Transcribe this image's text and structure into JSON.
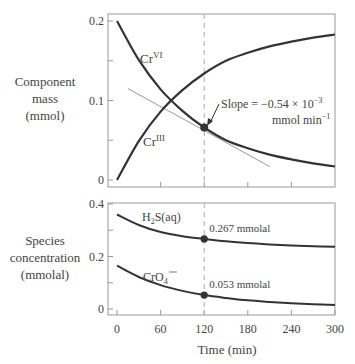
{
  "chart_data": [
    {
      "type": "line",
      "title": "",
      "ylabel": "Component mass (mmol)",
      "xlabel": "",
      "xlim": [
        0,
        300
      ],
      "ylim": [
        0,
        0.2
      ],
      "yticks": [
        0,
        0.1,
        0.2
      ],
      "yticklabels": [
        "0",
        "0.1",
        "0.2"
      ],
      "series": [
        {
          "name": "Cr^VI",
          "label": "Cr",
          "sup": "VI",
          "x": [
            0,
            30,
            60,
            90,
            120,
            150,
            180,
            210,
            240,
            270,
            300
          ],
          "values": [
            0.2,
            0.151,
            0.114,
            0.087,
            0.066,
            0.05,
            0.04,
            0.032,
            0.026,
            0.021,
            0.017
          ]
        },
        {
          "name": "Cr^III",
          "label": "Cr",
          "sup": "III",
          "x": [
            0,
            30,
            60,
            90,
            120,
            150,
            180,
            210,
            240,
            270,
            300
          ],
          "values": [
            0.0,
            0.049,
            0.086,
            0.113,
            0.134,
            0.15,
            0.16,
            0.168,
            0.174,
            0.179,
            0.183
          ]
        }
      ],
      "tangent": {
        "x": [
          15,
          210
        ],
        "values": [
          0.115,
          0.017
        ]
      },
      "marker": {
        "x": 120,
        "y": 0.066
      },
      "annotation": {
        "line1": "Slope = −0.54 × 10",
        "line1_sup": "−3",
        "line2": "mmol min",
        "line2_sup": "−1"
      },
      "vline_x": 120
    },
    {
      "type": "line",
      "ylabel": "Species concentration (mmolal)",
      "xlabel": "Time (min)",
      "xlim": [
        0,
        300
      ],
      "ylim": [
        0,
        0.4
      ],
      "xticks": [
        0,
        60,
        120,
        180,
        240,
        300
      ],
      "xticklabels": [
        "0",
        "60",
        "120",
        "180",
        "240",
        "300"
      ],
      "yticks": [
        0,
        0.2,
        0.4
      ],
      "yticklabels": [
        "0",
        "0.2",
        "0.4"
      ],
      "series": [
        {
          "name": "H2S(aq)",
          "x": [
            0,
            30,
            60,
            90,
            120,
            150,
            180,
            210,
            240,
            270,
            300
          ],
          "values": [
            0.36,
            0.32,
            0.293,
            0.277,
            0.267,
            0.258,
            0.251,
            0.246,
            0.242,
            0.239,
            0.237
          ]
        },
        {
          "name": "CrO4--",
          "x": [
            0,
            30,
            60,
            90,
            120,
            150,
            180,
            210,
            240,
            270,
            300
          ],
          "values": [
            0.165,
            0.122,
            0.091,
            0.069,
            0.053,
            0.042,
            0.033,
            0.027,
            0.022,
            0.018,
            0.015
          ]
        }
      ],
      "markers": [
        {
          "x": 120,
          "y": 0.267,
          "label": "0.267 mmolal"
        },
        {
          "x": 120,
          "y": 0.053,
          "label": "0.053 mmolal"
        }
      ],
      "vline_x": 120
    }
  ],
  "labels": {
    "top_ylabel": [
      "Component",
      "mass",
      "(mmol)"
    ],
    "bottom_ylabel": [
      "Species",
      "concentration",
      "(mmolal)"
    ],
    "xlabel": "Time (min)",
    "h2s": "S(aq)",
    "cro4": "CrO"
  }
}
